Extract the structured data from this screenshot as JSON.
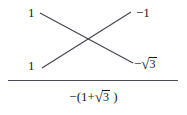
{
  "figure": {
    "type": "cross-multiplication-diagram",
    "title": "",
    "left_column": {
      "top": "1",
      "bottom": "1"
    },
    "right_column": {
      "top": "−1",
      "bottom_sign": "−",
      "bottom_radical": "√",
      "bottom_radicand": "3",
      "bottom_full": "−√3"
    },
    "cross_lines": [
      {
        "name": "descending-line",
        "from": [
          40,
          13
        ],
        "to": [
          133,
          63
        ]
      },
      {
        "name": "ascending-line",
        "from": [
          42,
          68
        ],
        "to": [
          131,
          12
        ]
      }
    ],
    "divider": {
      "x_start": 8,
      "x_end": 178,
      "y": 80,
      "color": "#4a4a52"
    },
    "result": {
      "prefix": "−(1+",
      "radical": "√",
      "radicand": "3",
      "suffix": " )",
      "full": "−(1+√3 )"
    },
    "colors": {
      "ink": "#1a1a1a",
      "line": "#4a4a52",
      "background": "#ffffff"
    }
  }
}
